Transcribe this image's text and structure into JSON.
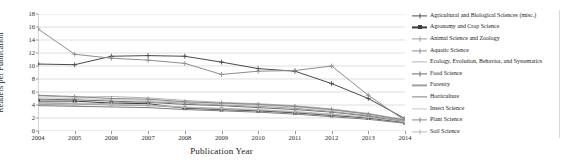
{
  "chart_data": {
    "type": "line",
    "title": "",
    "xlabel": "Publication Year",
    "ylabel": "Readers per Publication",
    "x": [
      2004,
      2005,
      2006,
      2007,
      2008,
      2009,
      2010,
      2011,
      2012,
      2013,
      2014
    ],
    "xlim": [
      2004,
      2014
    ],
    "ylim": [
      0,
      18
    ],
    "yticks": [
      0,
      2,
      4,
      6,
      8,
      10,
      12,
      14,
      16,
      18
    ],
    "xticks": [
      "2004",
      "2005",
      "2006",
      "2007",
      "2008",
      "2009",
      "2010",
      "2011",
      "2012",
      "2013",
      "2014"
    ],
    "grid": "horizontal",
    "legend_position": "right",
    "series": [
      {
        "name": "Agricultural and Biological Sciences (misc.)",
        "color": "#4a4a4a",
        "marker": "plus",
        "values": [
          10.3,
          10.2,
          11.5,
          11.6,
          11.5,
          10.6,
          9.6,
          9.2,
          7.3,
          5.0,
          1.9
        ]
      },
      {
        "name": "Agronomy and Crop Science",
        "color": "#3b3b3b",
        "marker": "square",
        "values": [
          4.6,
          4.6,
          4.3,
          4.2,
          3.5,
          3.3,
          3.1,
          2.8,
          2.4,
          2.0,
          1.3
        ]
      },
      {
        "name": "Animal Science and Zoology",
        "color": "#9d9d9d",
        "marker": "plus",
        "values": [
          4.3,
          4.2,
          4.0,
          3.9,
          3.6,
          3.4,
          3.2,
          2.9,
          2.5,
          2.1,
          1.5
        ]
      },
      {
        "name": "Aquatic Science",
        "color": "#8d8d8d",
        "marker": "plus",
        "values": [
          15.7,
          11.8,
          11.2,
          10.9,
          10.4,
          8.7,
          9.2,
          9.3,
          10.0,
          5.5,
          1.6
        ]
      },
      {
        "name": "Ecology, Evolution, Behavior, and Systematics",
        "color": "#b4b4b4",
        "marker": "line",
        "values": [
          5.4,
          5.2,
          5.3,
          5.1,
          4.7,
          4.4,
          4.2,
          3.9,
          3.4,
          2.7,
          1.7
        ]
      },
      {
        "name": "Food Science",
        "color": "#6f6f6f",
        "marker": "plus",
        "values": [
          4.9,
          4.8,
          4.6,
          4.4,
          4.1,
          3.9,
          3.6,
          3.3,
          2.9,
          2.3,
          1.4
        ]
      },
      {
        "name": "Forestry",
        "color": "#a0a0a0",
        "marker": "line",
        "values": [
          4.1,
          4.0,
          4.3,
          4.5,
          4.3,
          4.0,
          3.8,
          3.5,
          3.0,
          2.4,
          1.6
        ]
      },
      {
        "name": "Horticulture",
        "color": "#7d7d7d",
        "marker": "line",
        "values": [
          3.9,
          3.8,
          3.7,
          3.6,
          3.3,
          3.1,
          2.9,
          2.6,
          2.2,
          1.8,
          1.2
        ]
      },
      {
        "name": "Insect Science",
        "color": "#c5c5c5",
        "marker": "line",
        "values": [
          5.1,
          5.0,
          4.8,
          4.7,
          4.4,
          4.2,
          4.0,
          3.7,
          3.2,
          2.6,
          1.8
        ]
      },
      {
        "name": "Plant Science",
        "color": "#888888",
        "marker": "plus",
        "values": [
          5.5,
          5.3,
          5.0,
          4.9,
          4.5,
          4.3,
          4.1,
          3.8,
          3.3,
          2.6,
          1.7
        ]
      },
      {
        "name": "Soil Science",
        "color": "#b9b9b9",
        "marker": "plus",
        "values": [
          4.4,
          4.3,
          4.1,
          4.0,
          3.7,
          3.5,
          3.3,
          3.0,
          2.6,
          2.1,
          1.4
        ]
      }
    ]
  }
}
